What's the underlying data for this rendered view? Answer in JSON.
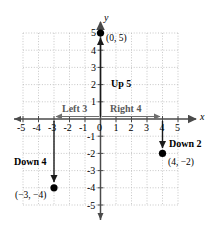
{
  "figure": {
    "kind": "coordinate-plane-diagram",
    "axis_labels": {
      "x": "x",
      "y": "y"
    },
    "x_ticks": [
      "-5",
      "-4",
      "-3",
      "-2",
      "-1",
      "0",
      "1",
      "2",
      "3",
      "4",
      "5"
    ],
    "y_ticks_positive": [
      "1",
      "2",
      "3",
      "4",
      "5"
    ],
    "y_ticks_negative": [
      "-1",
      "-2",
      "-3",
      "-4",
      "-5"
    ],
    "grid": {
      "visible": true,
      "style": "dotted",
      "color": "#b9b9b9",
      "x_min": -5,
      "x_max": 5,
      "y_min": -5,
      "y_max": 5
    },
    "axis_color": "#4a4a4a",
    "point_color": "#000000",
    "points": [
      {
        "name": "point-0-5",
        "label": "(0, 5)",
        "x": 0,
        "y": 5
      },
      {
        "name": "point-4-neg2",
        "label": "(4, −2)",
        "x": 4,
        "y": -2
      },
      {
        "name": "point-neg3-neg4",
        "label": "(−3, −4)",
        "x": -3,
        "y": -4
      }
    ],
    "movements": [
      {
        "name": "up-5",
        "label": "Up 5",
        "direction": "up",
        "magnitude": 5,
        "emphasis": "dark"
      },
      {
        "name": "right-4",
        "label": "Right 4",
        "direction": "right",
        "magnitude": 4,
        "emphasis": "gray"
      },
      {
        "name": "left-3",
        "label": "Left 3",
        "direction": "left",
        "magnitude": 3,
        "emphasis": "gray"
      },
      {
        "name": "down-2",
        "label": "Down 2",
        "direction": "down",
        "magnitude": 2,
        "emphasis": "dark"
      },
      {
        "name": "down-4",
        "label": "Down 4",
        "direction": "down",
        "magnitude": 4,
        "emphasis": "dark"
      }
    ]
  }
}
